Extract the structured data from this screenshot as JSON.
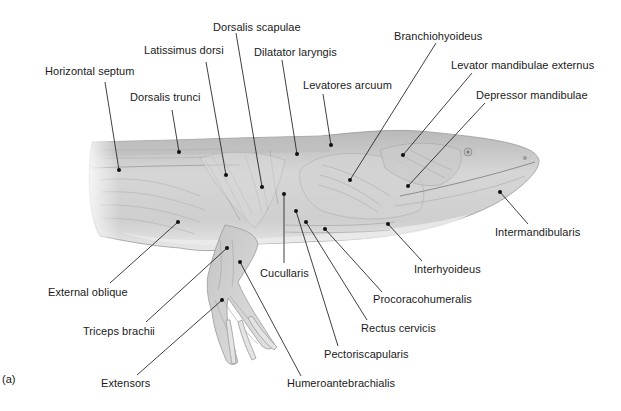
{
  "figure": {
    "panel_label": "(a)",
    "colors": {
      "background": "#ffffff",
      "text": "#1a1a1a",
      "leader_line": "#2a2a2a",
      "body_fill": "#d4d4d4",
      "body_shade": "#a8a8a8"
    }
  },
  "labels": [
    {
      "id": "horizontal-septum",
      "text": "Horizontal septum",
      "x": 45,
      "y": 71,
      "dot": [
        119,
        170
      ]
    },
    {
      "id": "dorsalis-trunci",
      "text": "Dorsalis trunci",
      "x": 130,
      "y": 97,
      "dot": [
        179,
        152
      ]
    },
    {
      "id": "latissimus-dorsi",
      "text": "Latissimus dorsi",
      "x": 144,
      "y": 50,
      "dot": [
        226,
        175
      ]
    },
    {
      "id": "dorsalis-scapulae",
      "text": "Dorsalis scapulae",
      "x": 213,
      "y": 21,
      "dot": [
        262,
        187
      ]
    },
    {
      "id": "dilatator-laryngis",
      "text": "Dilatator laryngis",
      "x": 254,
      "y": 47,
      "dot": [
        297,
        154
      ]
    },
    {
      "id": "levatores-arcuum",
      "text": "Levatores arcuum",
      "x": 383,
      "y": 80,
      "dot": [
        331,
        145
      ]
    },
    {
      "id": "branchiohyoideus",
      "text": "Branchiohyoideus",
      "x": 394,
      "y": 31,
      "dot": [
        350,
        180
      ]
    },
    {
      "id": "levator-mandibulae-externus",
      "text": "Levator mandibulae externus",
      "x": 451,
      "y": 60,
      "dot": [
        403,
        155
      ]
    },
    {
      "id": "depressor-mandibulae",
      "text": "Depressor mandibulae",
      "x": 476,
      "y": 90,
      "dot": [
        408,
        186
      ]
    },
    {
      "id": "intermandibularis",
      "text": "Intermandibularis",
      "x": 495,
      "y": 226,
      "dot": [
        500,
        192
      ]
    },
    {
      "id": "interhyoideus",
      "text": "Interhyoideus",
      "x": 415,
      "y": 262,
      "dot": [
        388,
        224
      ]
    },
    {
      "id": "procoracohumeralis",
      "text": "Procoracohumeralis",
      "x": 372,
      "y": 292,
      "dot": [
        325,
        229
      ]
    },
    {
      "id": "rectus-cervicis",
      "text": "Rectus cervicis",
      "x": 361,
      "y": 321,
      "dot": [
        306,
        222
      ]
    },
    {
      "id": "pectoriscapularis",
      "text": "Pectoriscapularis",
      "x": 324,
      "y": 347,
      "dot": [
        296,
        211
      ]
    },
    {
      "id": "humeroantebrachialis",
      "text": "Humeroantebrachialis",
      "x": 287,
      "y": 377,
      "dot": [
        240,
        262
      ]
    },
    {
      "id": "cucullaris",
      "text": "Cucullaris",
      "x": 261,
      "y": 266,
      "dot": [
        284,
        194
      ]
    },
    {
      "id": "external-oblique",
      "text": "External oblique",
      "x": 48,
      "y": 287,
      "dot": [
        178,
        222
      ]
    },
    {
      "id": "triceps-brachii",
      "text": "Triceps brachii",
      "x": 83,
      "y": 326,
      "dot": [
        227,
        248
      ]
    },
    {
      "id": "extensors",
      "text": "Extensors",
      "x": 101,
      "y": 377,
      "dot": [
        222,
        300
      ]
    }
  ]
}
